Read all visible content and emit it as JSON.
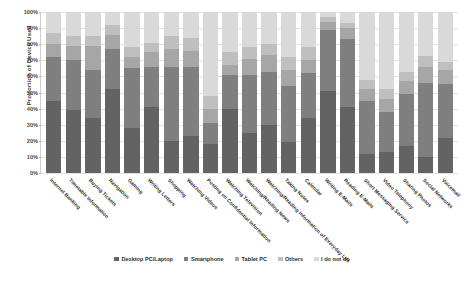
{
  "chart_data": {
    "type": "bar",
    "subtype": "stacked-100-percent",
    "title": "",
    "xlabel": "",
    "ylabel": "Proportion of Device Used",
    "ylim": [
      0,
      100
    ],
    "ytick_labels": [
      "100%",
      "90%",
      "80%",
      "70%",
      "60%",
      "50%",
      "40%",
      "30%",
      "20%",
      "10%",
      "0%"
    ],
    "ytick_values": [
      100,
      90,
      80,
      70,
      60,
      50,
      40,
      30,
      20,
      10,
      0
    ],
    "grid": true,
    "legend_position": "bottom",
    "categories": [
      "Internet Banking",
      "Timetable Information",
      "Buying Tickets",
      "Navigation",
      "Gaming",
      "Writing Letters",
      "Shopping",
      "Watching Videos",
      "Posting on Confidential Information",
      "Watching Television",
      "Watching/Reading News",
      "Watching/Reading Information of Everyday Life",
      "Taking Notes",
      "Calendar",
      "Writing E-Mails",
      "Reading E-Mails",
      "Short Messaging Service",
      "Video Telephony",
      "Sharing Photos",
      "Social Networks",
      "Voicemail"
    ],
    "series": [
      {
        "name": "Desktop PC/Laptop",
        "color": "#636363",
        "values": [
          45,
          39,
          34,
          52,
          28,
          41,
          20,
          23,
          18,
          40,
          25,
          30,
          19,
          34,
          51,
          41,
          12,
          13,
          17,
          10,
          22
        ]
      },
      {
        "name": "Smartphone",
        "color": "#7f7f7f",
        "values": [
          27,
          31,
          30,
          25,
          37,
          25,
          46,
          43,
          13,
          21,
          36,
          33,
          35,
          28,
          38,
          42,
          33,
          25,
          32,
          46,
          33
        ]
      },
      {
        "name": "Tablet PC",
        "color": "#a6a6a6",
        "values": [
          8,
          9,
          15,
          9,
          7,
          9,
          11,
          10,
          9,
          6,
          10,
          10,
          10,
          8,
          5,
          7,
          7,
          8,
          8,
          10,
          9
        ]
      },
      {
        "name": "Others",
        "color": "#bfbfbf",
        "values": [
          7,
          6,
          6,
          6,
          6,
          6,
          8,
          8,
          8,
          8,
          7,
          7,
          8,
          8,
          3,
          3,
          6,
          6,
          6,
          7,
          5
        ]
      },
      {
        "name": "I do not do",
        "color": "#d9d9d9",
        "values": [
          13,
          15,
          15,
          8,
          22,
          19,
          15,
          16,
          52,
          25,
          22,
          20,
          28,
          22,
          3,
          7,
          42,
          48,
          37,
          27,
          31
        ]
      }
    ]
  }
}
